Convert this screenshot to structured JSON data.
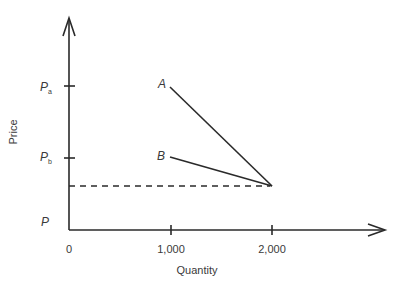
{
  "diagram": {
    "y_axis_label": "Price",
    "x_axis_label": "Quantity",
    "origin_label": "0",
    "x_ticks": [
      {
        "label": "1,000",
        "value": 1000
      },
      {
        "label": "2,000",
        "value": 2000
      }
    ],
    "y_labels": {
      "pa_main": "P",
      "pa_sub": "a",
      "pb_main": "P",
      "pb_sub": "b",
      "p_main": "P"
    },
    "curves": [
      {
        "name": "A",
        "label": "A",
        "from": {
          "quantity": 1000,
          "price": "Pa"
        },
        "to": {
          "quantity": 2000,
          "price": "P"
        }
      },
      {
        "name": "B",
        "label": "B",
        "from": {
          "quantity": 1000,
          "price": "Pb"
        },
        "to": {
          "quantity": 2000,
          "price": "P"
        }
      }
    ],
    "reference_line": {
      "style": "dashed",
      "price_level": "P",
      "from_quantity": 0,
      "to_quantity": 2000
    },
    "colors": {
      "line": "#2a2a2a",
      "text": "#3a3a3a",
      "background": "#ffffff"
    }
  }
}
